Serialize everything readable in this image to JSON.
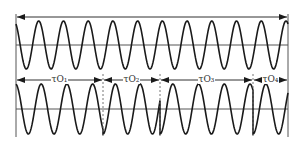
{
  "figure": {
    "colors": {
      "line": "#1a1a1a",
      "axis": "#555555",
      "divider": "#666666",
      "background": "#ffffff"
    },
    "top_panel": {
      "arrow": "double-headed span arrow across full width",
      "cycles": 11
    },
    "bottom_panel": {
      "segments": [
        {
          "label": "τO₁",
          "x_start": 16,
          "x_end": 103
        },
        {
          "label": "τO₂",
          "x_start": 103,
          "x_end": 160
        },
        {
          "label": "τO₃",
          "x_start": 160,
          "x_end": 253
        },
        {
          "label": "τO₄",
          "x_start": 253,
          "x_end": 288
        }
      ],
      "dividers_x": [
        103,
        160,
        253
      ]
    },
    "geometry": {
      "left": 16,
      "right": 288,
      "top_arrow_y": 17,
      "top_axis_y": 45,
      "top_amp": 24,
      "bottom_arrow_y": 80,
      "bottom_axis_y": 109,
      "bottom_amp": 25
    }
  }
}
